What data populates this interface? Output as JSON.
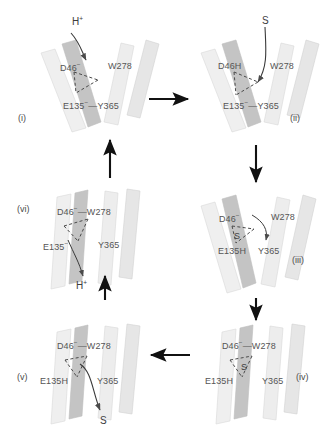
{
  "figure": {
    "panels": [
      {
        "id": "i",
        "roman": "(i)",
        "state": "outward-open, deprotonated",
        "labels": {
          "d46": "D46",
          "d46_charge": "−",
          "w278": "W278",
          "e135": "E135",
          "e135_charge": "−",
          "link": "—",
          "y365": "Y365"
        },
        "species": {
          "text": "H",
          "charge": "+"
        },
        "species_role": "proton-binding"
      },
      {
        "id": "ii",
        "roman": "(ii)",
        "state": "outward-open, D46 protonated",
        "labels": {
          "d46": "D46H",
          "w278": "W278",
          "e135": "E135",
          "e135_charge": "−",
          "link": "—",
          "y365": "Y365"
        },
        "species": {
          "text": "S",
          "charge": ""
        },
        "species_role": "substrate-binding"
      },
      {
        "id": "iii",
        "roman": "(iii)",
        "state": "outward-open, proton transferred to E135",
        "labels": {
          "d46": "D46",
          "d46_charge": "−",
          "w278": "W278",
          "e135": "E135H",
          "y365": "Y365"
        },
        "species": {
          "text": "S",
          "charge": ""
        },
        "species_role": "substrate-bound-in-site"
      },
      {
        "id": "iv",
        "roman": "(iv)",
        "state": "occluded / inward-facing, substrate bound",
        "labels": {
          "d46": "D46",
          "d46_charge": "−",
          "link": "—",
          "w278": "W278",
          "e135": "E135H",
          "y365": "Y365"
        },
        "species": {
          "text": "S",
          "charge": ""
        },
        "species_role": "substrate-bound-in-site"
      },
      {
        "id": "v",
        "roman": "(v)",
        "state": "inward-open, substrate release",
        "labels": {
          "d46": "D46",
          "d46_charge": "−",
          "link": "—",
          "w278": "W278",
          "e135": "E135H",
          "y365": "Y365"
        },
        "species": {
          "text": "S",
          "charge": ""
        },
        "species_role": "substrate-release"
      },
      {
        "id": "vi",
        "roman": "(vi)",
        "state": "inward-open, proton release",
        "labels": {
          "d46": "D46",
          "d46_charge": "−",
          "link": "—",
          "w278": "W278",
          "e135": "E135",
          "e135_charge": "−",
          "y365": "Y365"
        },
        "species": {
          "text": "H",
          "charge": "+"
        },
        "species_role": "proton-release"
      }
    ],
    "cycle_arrows": [
      {
        "name": "arrow-i-to-ii",
        "direction": "right"
      },
      {
        "name": "arrow-ii-to-iii",
        "direction": "down"
      },
      {
        "name": "arrow-iii-to-iv",
        "direction": "down"
      },
      {
        "name": "arrow-iv-to-v",
        "direction": "left"
      },
      {
        "name": "arrow-v-to-vi",
        "direction": "up"
      },
      {
        "name": "arrow-vi-to-i",
        "direction": "up"
      }
    ],
    "colors": {
      "helix_light": "#eeeeee",
      "helix_mid": "#e0e0e0",
      "helix_dark": "#c9c9c9",
      "helix_darker": "#b9b9b9",
      "outline": "#d2d2d2",
      "text": "#555555",
      "arrow": "#111111",
      "dashed": "#444444"
    }
  }
}
